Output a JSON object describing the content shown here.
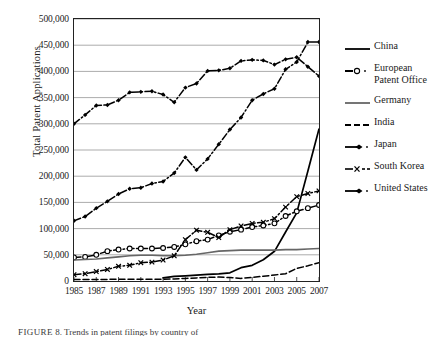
{
  "chart_data": {
    "type": "line",
    "title": "",
    "xlabel": "Year",
    "ylabel": "Total Patent Applications",
    "xlim": [
      1985,
      2007
    ],
    "ylim": [
      0,
      500000
    ],
    "grid": true,
    "legend_position": "right",
    "x": [
      1985,
      1986,
      1987,
      1988,
      1989,
      1990,
      1991,
      1992,
      1993,
      1994,
      1995,
      1996,
      1997,
      1998,
      1999,
      2000,
      2001,
      2002,
      2003,
      2004,
      2005,
      2006,
      2007
    ],
    "xticks": [
      "1985",
      "1987",
      "1989",
      "1991",
      "1993",
      "1995",
      "1997",
      "1999",
      "2001",
      "2003",
      "2005",
      "2007"
    ],
    "yticks": [
      "0",
      "50,000",
      "100,000",
      "150,000",
      "200,000",
      "250,000",
      "300,000",
      "350,000",
      "400,000",
      "450,000",
      "500,000"
    ],
    "series": [
      {
        "name": "China",
        "style": "solid",
        "marker": "none",
        "color": "#000000",
        "values": [
          null,
          null,
          null,
          null,
          null,
          null,
          null,
          null,
          6000,
          9000,
          10000,
          11000,
          12500,
          13700,
          15600,
          25300,
          30000,
          40400,
          56700,
          93500,
          130000,
          210000,
          290000
        ]
      },
      {
        "name": "European Patent Office",
        "style": "dash-dot",
        "marker": "circle",
        "color": "#000000",
        "values": [
          45000,
          46000,
          50000,
          57000,
          60000,
          62000,
          62000,
          62000,
          63000,
          65000,
          70000,
          76000,
          79000,
          87000,
          94000,
          98000,
          103000,
          106000,
          110000,
          124000,
          133000,
          139000,
          145000
        ]
      },
      {
        "name": "Germany",
        "style": "solid",
        "marker": "none",
        "color": "#666666",
        "values": [
          40000,
          41000,
          42000,
          44000,
          46000,
          48000,
          49000,
          49000,
          48000,
          48000,
          49000,
          51000,
          54000,
          57000,
          58000,
          59000,
          59000,
          59000,
          59000,
          60000,
          60000,
          61000,
          62000
        ]
      },
      {
        "name": "India",
        "style": "dashed",
        "marker": "none",
        "color": "#000000",
        "values": [
          3000,
          3000,
          3000,
          3000,
          3500,
          3500,
          3500,
          3500,
          3500,
          4000,
          5000,
          6000,
          7000,
          7500,
          6500,
          5000,
          7000,
          9000,
          11500,
          14000,
          24000,
          29000,
          35000
        ]
      },
      {
        "name": "Japan",
        "style": "dash-dot",
        "marker": "diamond",
        "color": "#000000",
        "values": [
          300000,
          317000,
          335000,
          336000,
          345000,
          360000,
          361000,
          362000,
          356000,
          341000,
          369000,
          377000,
          401000,
          402000,
          406000,
          420000,
          422000,
          421000,
          413000,
          423000,
          427000,
          409000,
          391000
        ]
      },
      {
        "name": "South Korea",
        "style": "dash-dot",
        "marker": "x",
        "color": "#000000",
        "values": [
          12000,
          14000,
          18000,
          22000,
          28000,
          30000,
          35000,
          36000,
          40000,
          48000,
          79000,
          97000,
          93000,
          83000,
          98000,
          105000,
          110000,
          112000,
          119000,
          141000,
          161000,
          167000,
          172000
        ]
      },
      {
        "name": "United States",
        "style": "dash-dot",
        "marker": "diamond",
        "color": "#000000",
        "values": [
          115000,
          123000,
          139000,
          152000,
          166000,
          176000,
          178000,
          186000,
          190000,
          206000,
          236000,
          212000,
          233000,
          261000,
          289000,
          312000,
          345000,
          357000,
          367000,
          404000,
          418000,
          456000,
          456000
        ]
      }
    ]
  },
  "legend": {
    "items": [
      {
        "label": "China"
      },
      {
        "label": "European Patent Office"
      },
      {
        "label": "Germany"
      },
      {
        "label": "India"
      },
      {
        "label": "Japan"
      },
      {
        "label": "South Korea"
      },
      {
        "label": "United States"
      }
    ]
  },
  "caption": {
    "prefix": "FIGURE",
    "number": "8.",
    "text": "Trends in patent filings by country of"
  }
}
